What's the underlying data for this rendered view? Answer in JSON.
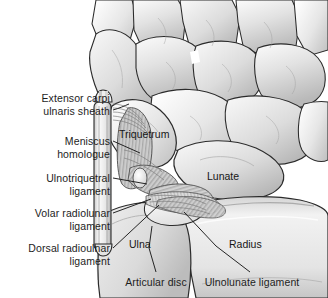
{
  "figure": {
    "style": "grayscale-medical-illustration",
    "width": 328,
    "height": 298,
    "background_color": "#ffffff",
    "text_color": "#1d1d1d",
    "leader_line_color": "#1a1a1a"
  },
  "callout_labels": [
    {
      "id": "extensor-carpi-ulnaris-sheath",
      "text": "Extensor carpi\nulnaris sheath",
      "align": "right",
      "x": 10,
      "y": 92,
      "width": 100,
      "leader": "M 113,110 L 128,104"
    },
    {
      "id": "meniscus-homologue",
      "text": "Meniscus\nhomologue",
      "align": "right",
      "x": 18,
      "y": 135,
      "width": 92,
      "leader": "M 113,141 L 139,152"
    },
    {
      "id": "ulnotriquetral-ligament",
      "text": "Ulnotriquetral\nligament",
      "align": "right",
      "x": 8,
      "y": 172,
      "width": 102,
      "leader": "M 113,178 L 146,183"
    },
    {
      "id": "volar-radiolunar-ligament",
      "text": "Volar radiolunar\nligament",
      "align": "right",
      "x": 2,
      "y": 207,
      "width": 108,
      "leader": "M 113,213 L 150,199"
    },
    {
      "id": "dorsal-radioulnar-ligament",
      "text": "Dorsal radioulnar\nligament",
      "align": "right",
      "x": 0,
      "y": 242,
      "width": 110,
      "leader": "M 113,248 L 158,205"
    },
    {
      "id": "articular-disc",
      "text": "Articular disc",
      "align": "center",
      "x": 120,
      "y": 276,
      "width": 72,
      "leader": "M 156,274 L 146,249 L 150,228"
    },
    {
      "id": "ulnolunate-ligament",
      "text": "Ulnolunate ligament",
      "align": "center",
      "x": 198,
      "y": 276,
      "width": 108,
      "leader": "M 252,274 L 216,248 L 182,212"
    }
  ],
  "inline_labels": [
    {
      "id": "triquetrum",
      "text": "Triquetrum",
      "x": 119,
      "y": 128
    },
    {
      "id": "lunate",
      "text": "Lunate",
      "x": 207,
      "y": 170
    },
    {
      "id": "ulna",
      "text": "Ulna",
      "x": 129,
      "y": 238
    },
    {
      "id": "radius",
      "text": "Radius",
      "x": 229,
      "y": 238
    }
  ],
  "anatomy_parts": [
    {
      "id": "carpal-row",
      "name": "Distal and proximal carpal bones",
      "tone": "#d8d8d8"
    },
    {
      "id": "triquetrum-bone",
      "name": "Triquetrum",
      "tone": "#d2d2d2"
    },
    {
      "id": "lunate-bone",
      "name": "Lunate",
      "tone": "#d5d5d5"
    },
    {
      "id": "ulna-bone",
      "name": "Ulna",
      "tone": "#cfcfcf"
    },
    {
      "id": "radius-bone",
      "name": "Radius",
      "tone": "#dcdcdc"
    },
    {
      "id": "ecu-sheath",
      "name": "Extensor carpi ulnaris sheath",
      "tone": "#e2e2e2"
    },
    {
      "id": "articular-disc-shape",
      "name": "Articular disc",
      "tone": "#efefef"
    },
    {
      "id": "ligament-fibers",
      "name": "Fibrous ligament bands",
      "tone": "#bdbdbd"
    }
  ]
}
